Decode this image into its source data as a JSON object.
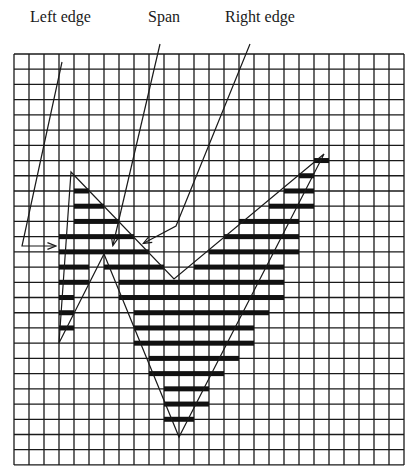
{
  "labels": {
    "left_edge": "Left edge",
    "span": "Span",
    "right_edge": "Right edge"
  },
  "grid": {
    "x0": 14,
    "y0": 54,
    "cols": 26,
    "rows": 27,
    "cell_w": 15,
    "cell_h": 15.22,
    "line_color": "#1a1a1a"
  },
  "polygon": {
    "vertices": [
      [
        71,
        172
      ],
      [
        174,
        279
      ],
      [
        324,
        154
      ],
      [
        179,
        437
      ],
      [
        104,
        254
      ],
      [
        59,
        343
      ]
    ],
    "stroke": "#1a1a1a"
  },
  "spans": [
    {
      "row": 7,
      "segments": [
        [
          20,
          21
        ]
      ]
    },
    {
      "row": 8,
      "segments": [
        [
          19,
          20
        ]
      ]
    },
    {
      "row": 9,
      "segments": [
        [
          4,
          5
        ],
        [
          18,
          20
        ]
      ]
    },
    {
      "row": 10,
      "segments": [
        [
          4,
          6
        ],
        [
          17,
          20
        ]
      ]
    },
    {
      "row": 11,
      "segments": [
        [
          4,
          7
        ],
        [
          15,
          19
        ]
      ]
    },
    {
      "row": 12,
      "segments": [
        [
          3,
          8
        ],
        [
          14,
          19
        ]
      ]
    },
    {
      "row": 13,
      "segments": [
        [
          3,
          9
        ],
        [
          13,
          19
        ]
      ]
    },
    {
      "row": 14,
      "segments": [
        [
          3,
          5
        ],
        [
          6,
          10
        ],
        [
          12,
          18
        ]
      ]
    },
    {
      "row": 15,
      "segments": [
        [
          3,
          5
        ],
        [
          7,
          18
        ]
      ]
    },
    {
      "row": 16,
      "segments": [
        [
          3,
          4
        ],
        [
          7,
          18
        ]
      ]
    },
    {
      "row": 17,
      "segments": [
        [
          3,
          4
        ],
        [
          8,
          17
        ]
      ]
    },
    {
      "row": 18,
      "segments": [
        [
          3,
          4
        ],
        [
          8,
          16
        ]
      ]
    },
    {
      "row": 19,
      "segments": [
        [
          8,
          16
        ]
      ]
    },
    {
      "row": 20,
      "segments": [
        [
          9,
          15
        ]
      ]
    },
    {
      "row": 21,
      "segments": [
        [
          9,
          14
        ]
      ]
    },
    {
      "row": 22,
      "segments": [
        [
          10,
          13
        ]
      ]
    },
    {
      "row": 23,
      "segments": [
        [
          10,
          13
        ]
      ]
    },
    {
      "row": 24,
      "segments": [
        [
          10,
          12
        ]
      ]
    }
  ],
  "arrows": {
    "left_edge": {
      "points": [
        [
          62,
          62
        ],
        [
          22,
          246
        ],
        [
          55,
          246
        ]
      ]
    },
    "span": {
      "points": [
        [
          160,
          44
        ],
        [
          113,
          245
        ]
      ]
    },
    "right_edge": {
      "points": [
        [
          250,
          44
        ],
        [
          176,
          226
        ],
        [
          144,
          243
        ]
      ]
    }
  }
}
